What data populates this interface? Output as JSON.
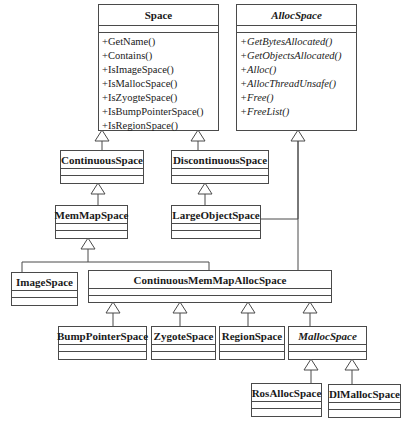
{
  "diagram": {
    "type": "uml-class-diagram",
    "classes": [
      {
        "id": "Space",
        "name": "Space",
        "abstract": false,
        "x": 98,
        "y": 4,
        "w": 120,
        "h": 126,
        "head": 21,
        "attr": 7,
        "methods": [
          "+GetName()",
          "+Contains()",
          "+IsImageSpace()",
          "+IsMallocSpace()",
          "+IsZyogteSpace()",
          "+IsBumpPointerSpace()",
          "+IsRegionSpace()"
        ]
      },
      {
        "id": "AllocSpace",
        "name": "AllocSpace",
        "abstract": true,
        "x": 236,
        "y": 4,
        "w": 120,
        "h": 126,
        "head": 21,
        "attr": 7,
        "methods": [
          "+GetBytesAllocated()",
          "+GetObjectsAllocated()",
          "+Alloc()",
          "+AllocThreadUnsafe()",
          "+Free()",
          "+FreeList()"
        ]
      },
      {
        "id": "ContinuousSpace",
        "name": "ContinuousSpace",
        "abstract": false,
        "x": 60,
        "y": 150,
        "w": 83,
        "h": 33,
        "head": 18,
        "attr": 7,
        "methods": []
      },
      {
        "id": "DiscontinuousSpace",
        "name": "DiscontinuousSpace",
        "abstract": false,
        "x": 171,
        "y": 150,
        "w": 97,
        "h": 33,
        "head": 18,
        "attr": 7,
        "methods": []
      },
      {
        "id": "MemMapSpace",
        "name": "MemMapSpace",
        "abstract": false,
        "x": 55,
        "y": 205,
        "w": 72,
        "h": 33,
        "head": 18,
        "attr": 7,
        "methods": []
      },
      {
        "id": "LargeObjectSpace",
        "name": "LargeObjectSpace",
        "abstract": false,
        "x": 171,
        "y": 205,
        "w": 89,
        "h": 33,
        "head": 18,
        "attr": 7,
        "methods": []
      },
      {
        "id": "ImageSpace",
        "name": "ImageSpace",
        "abstract": false,
        "x": 11,
        "y": 272,
        "w": 66,
        "h": 33,
        "head": 18,
        "attr": 7,
        "methods": []
      },
      {
        "id": "ContinuousMemMapAllocSpace",
        "name": "ContinuousMemMapAllocSpace",
        "abstract": false,
        "x": 88,
        "y": 270,
        "w": 243,
        "h": 32,
        "head": 18,
        "attr": 7,
        "methods": []
      },
      {
        "id": "BumpPointerSpace",
        "name": "BumpPointerSpace",
        "abstract": false,
        "x": 58,
        "y": 326,
        "w": 88,
        "h": 33,
        "head": 18,
        "attr": 7,
        "methods": []
      },
      {
        "id": "ZygoteSpace",
        "name": "ZygoteSpace",
        "abstract": false,
        "x": 151,
        "y": 326,
        "w": 64,
        "h": 33,
        "head": 18,
        "attr": 7,
        "methods": []
      },
      {
        "id": "RegionSpace",
        "name": "RegionSpace",
        "abstract": false,
        "x": 219,
        "y": 326,
        "w": 65,
        "h": 33,
        "head": 18,
        "attr": 7,
        "methods": []
      },
      {
        "id": "MallocSpace",
        "name": "MallocSpace",
        "abstract": true,
        "x": 288,
        "y": 326,
        "w": 78,
        "h": 33,
        "head": 18,
        "attr": 7,
        "methods": []
      },
      {
        "id": "RosAllocSpace",
        "name": "RosAllocSpace",
        "abstract": false,
        "x": 251,
        "y": 383,
        "w": 70,
        "h": 33,
        "head": 18,
        "attr": 7,
        "methods": []
      },
      {
        "id": "DlMallocSpace",
        "name": "DlMallocSpace",
        "abstract": false,
        "x": 328,
        "y": 384,
        "w": 72,
        "h": 33,
        "head": 18,
        "attr": 7,
        "methods": []
      }
    ],
    "generalizations": [
      {
        "child": "ContinuousSpace",
        "parent": "Space",
        "points": [
          [
            102,
            150
          ],
          [
            102,
            142
          ],
          [
            102,
            130
          ]
        ]
      },
      {
        "child": "DiscontinuousSpace",
        "parent": "Space",
        "points": [
          [
            198,
            150
          ],
          [
            198,
            142
          ],
          [
            198,
            130
          ]
        ]
      },
      {
        "child": "MemMapSpace",
        "parent": "ContinuousSpace",
        "points": [
          [
            98,
            205
          ],
          [
            98,
            196
          ],
          [
            98,
            183
          ]
        ]
      },
      {
        "child": "LargeObjectSpace",
        "parent": "DiscontinuousSpace",
        "points": [
          [
            205,
            205
          ],
          [
            205,
            196
          ],
          [
            205,
            183
          ]
        ]
      },
      {
        "child": "ImageSpace",
        "parent": "MemMapSpace",
        "points": [
          [
            22,
            272
          ],
          [
            22,
            262
          ],
          [
            88,
            262
          ],
          [
            88,
            238
          ]
        ],
        "arrowAt": [
          88,
          238
        ]
      },
      {
        "child": "ContinuousMemMapAllocSpace",
        "parent": "MemMapSpace",
        "points": [
          [
            209,
            270
          ],
          [
            209,
            262
          ],
          [
            88,
            262
          ]
        ],
        "noArrow": true
      },
      {
        "child": "LargeObjectSpace",
        "parent": "AllocSpace",
        "points": [
          [
            260,
            219
          ],
          [
            298,
            219
          ],
          [
            298,
            130
          ]
        ],
        "noArrow": true
      },
      {
        "child": "ContinuousMemMapAllocSpace",
        "parent": "AllocSpace",
        "points": [
          [
            298,
            270
          ],
          [
            298,
            130
          ]
        ],
        "arrowAt": [
          298,
          130
        ]
      },
      {
        "child": "BumpPointerSpace",
        "parent": "ContinuousMemMapAllocSpace",
        "points": [
          [
            113,
            326
          ],
          [
            113,
            302
          ]
        ],
        "arrowAt": [
          113,
          302
        ]
      },
      {
        "child": "ZygoteSpace",
        "parent": "ContinuousMemMapAllocSpace",
        "points": [
          [
            180,
            326
          ],
          [
            180,
            302
          ]
        ],
        "arrowAt": [
          180,
          302
        ]
      },
      {
        "child": "RegionSpace",
        "parent": "ContinuousMemMapAllocSpace",
        "points": [
          [
            248,
            326
          ],
          [
            248,
            302
          ]
        ],
        "arrowAt": [
          248,
          302
        ]
      },
      {
        "child": "MallocSpace",
        "parent": "ContinuousMemMapAllocSpace",
        "points": [
          [
            310,
            326
          ],
          [
            310,
            302
          ]
        ],
        "arrowAt": [
          310,
          302
        ]
      },
      {
        "child": "RosAllocSpace",
        "parent": "MallocSpace",
        "points": [
          [
            311,
            383
          ],
          [
            311,
            359
          ]
        ],
        "arrowAt": [
          311,
          359
        ]
      },
      {
        "child": "DlMallocSpace",
        "parent": "MallocSpace",
        "points": [
          [
            352,
            384
          ],
          [
            352,
            359
          ]
        ],
        "arrowAt": [
          352,
          359
        ]
      }
    ]
  }
}
